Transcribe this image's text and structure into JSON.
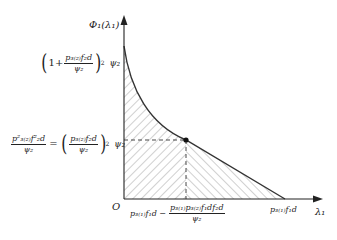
{
  "diagram": {
    "y_axis_label": "Φ₁(λ₁)",
    "x_axis_label": "λ₁",
    "origin_label": "O",
    "y_tick_top": {
      "label": "(1 + p3(2)f2d / ψ2)^2 ψ2",
      "one_plus": "1+",
      "num": "p₃₍₂₎f₂d",
      "den": "ψ₂",
      "exp": "2",
      "tail": "ψ₂"
    },
    "y_tick_mid": {
      "label": "p3(2)^2 f2d^2 / ψ2 = (p3(2)f2d / ψ2)^2 ψ2",
      "lhs_num": "p²₃₍₂₎f²₂d",
      "lhs_den": "ψ₂",
      "eq": "=",
      "rhs_num": "p₃₍₂₎f₂d",
      "rhs_den": "ψ₂",
      "exp": "2",
      "tail": "ψ₂"
    },
    "x_tick_mid": {
      "label": "p3(1)f1d − p3(1)p3(2)f1d f2d / ψ2",
      "lead": "p₃₍₁₎f₁d −",
      "num": "p₃₍₁₎p₃₍₂₎f₁df₂d",
      "den": "ψ₂"
    },
    "x_tick_end": {
      "label": "p3(1)f1d",
      "text": "p₃₍₁₎f₁d"
    },
    "curve_description": "convex decreasing curve from y-axis to marked point, then straight line to x-axis",
    "marked_point": "dot at intersection of dashed guides",
    "regions": [
      {
        "name": "left-region",
        "hatch": "forward-slash"
      },
      {
        "name": "right-region",
        "hatch": "back-slash"
      }
    ],
    "colors": {
      "line": "#333333",
      "hatch": "#888888",
      "background": "#ffffff"
    }
  }
}
